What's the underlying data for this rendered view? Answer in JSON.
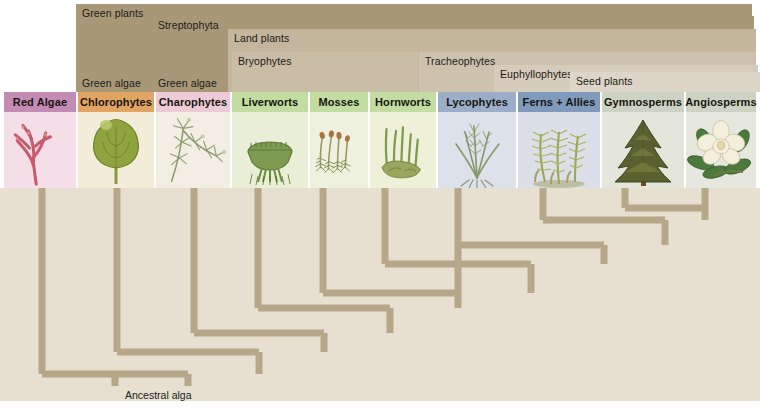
{
  "figure": {
    "type": "cladogram",
    "root_label": "Ancestral alga",
    "background_color": "#e7e0d0"
  },
  "clade_bands": [
    {
      "name": "green-plants",
      "label_top": "Green plants",
      "label_bottom": "Green algae",
      "color": "#a89878",
      "x": 76,
      "y": 4,
      "w": 676,
      "h": 88
    },
    {
      "name": "streptophyta",
      "label_top": "Streptophyta",
      "label_bottom": "Green algae",
      "color": "#a89878",
      "x": 152,
      "y": 16,
      "w": 602,
      "h": 76
    },
    {
      "name": "land-plants",
      "label_top": "Land plants",
      "label_bottom": "",
      "color": "#c4b69c",
      "x": 228,
      "y": 29,
      "w": 528,
      "h": 63
    },
    {
      "name": "bryophytes",
      "label_top": "Bryophytes",
      "label_bottom": "",
      "color": "#c9bda6",
      "x": 232,
      "y": 52,
      "w": 186,
      "h": 40
    },
    {
      "name": "tracheophytes",
      "label_top": "Tracheophytes",
      "label_bottom": "",
      "color": "#cdc2ae",
      "x": 419,
      "y": 52,
      "w": 337,
      "h": 40
    },
    {
      "name": "euphyllophytes",
      "label_top": "Euphyllophytes",
      "label_bottom": "",
      "color": "#d5ccbb",
      "x": 494,
      "y": 65,
      "w": 264,
      "h": 27
    },
    {
      "name": "seed-plants",
      "label_top": "Seed plants",
      "label_bottom": "",
      "color": "#ddd6c8",
      "x": 570,
      "y": 72,
      "w": 190,
      "h": 20
    }
  ],
  "taxa": [
    {
      "name": "red-algae",
      "label": "Red Algae",
      "tag_color": "#c48bb4",
      "panel_color": "#f4dfe9",
      "x": 4,
      "w": 72,
      "icon": "red-algae-icon"
    },
    {
      "name": "chlorophytes",
      "label": "Chlorophytes",
      "tag_color": "#e2a463",
      "panel_color": "#f2ecd9",
      "x": 78,
      "w": 76,
      "icon": "sea-lettuce-icon"
    },
    {
      "name": "charophytes",
      "label": "Charophytes",
      "tag_color": "#eec9d6",
      "panel_color": "#f2eee4",
      "x": 156,
      "w": 74,
      "icon": "chara-icon"
    },
    {
      "name": "liverworts",
      "label": "Liverworts",
      "tag_color": "#c3dca2",
      "panel_color": "#e9efd6",
      "x": 232,
      "w": 76,
      "icon": "liverwort-icon"
    },
    {
      "name": "mosses",
      "label": "Mosses",
      "tag_color": "#c3dca2",
      "panel_color": "#eef1de",
      "x": 310,
      "w": 58,
      "icon": "moss-icon"
    },
    {
      "name": "hornworts",
      "label": "Hornworts",
      "tag_color": "#c3dca2",
      "panel_color": "#eef0d8",
      "x": 370,
      "w": 66,
      "icon": "hornwort-icon"
    },
    {
      "name": "lycophytes",
      "label": "Lycophytes",
      "tag_color": "#9badc8",
      "panel_color": "#dde1ea",
      "x": 438,
      "w": 78,
      "icon": "lycophyte-icon"
    },
    {
      "name": "ferns-allies",
      "label": "Ferns + Allies",
      "tag_color": "#7f9abb",
      "panel_color": "#dbe0e8",
      "x": 518,
      "w": 82,
      "icon": "fern-icon"
    },
    {
      "name": "gymnosperms",
      "label": "Gymnosperms",
      "tag_color": "#cdd3c2",
      "panel_color": "#e4e6dc",
      "x": 602,
      "w": 82,
      "icon": "conifer-icon"
    },
    {
      "name": "angiosperms",
      "label": "Angiosperms",
      "tag_color": "#cdd3c2",
      "panel_color": "#e6e7de",
      "x": 686,
      "w": 70,
      "icon": "magnolia-icon"
    }
  ],
  "tree_geometry": {
    "branch_color": "#b6a789",
    "stroke_width": 7,
    "top_y": 0,
    "tips_x": [
      42,
      117,
      194,
      258,
      323,
      385,
      458,
      543,
      625,
      705
    ],
    "nodes": [
      {
        "name": "angiosperm-gymnosperm-node",
        "y": 20,
        "left": 625,
        "right": 705,
        "stem_to": 32
      },
      {
        "name": "seed-plants-node",
        "y": 32,
        "left": 543,
        "right": 665,
        "stem_to": 57
      },
      {
        "name": "euphyllophytes-node",
        "y": 57,
        "left": 458,
        "right": 604,
        "stem_to": 76
      },
      {
        "name": "tracheophytes-node",
        "y": 76,
        "left": 385,
        "right": 531,
        "stem_to": 105
      },
      {
        "name": "hornwort-node",
        "y": 105,
        "left": 323,
        "right": 458,
        "stem_to": 120
      },
      {
        "name": "moss-node",
        "y": 120,
        "left": 258,
        "right": 390,
        "stem_to": 145
      },
      {
        "name": "liverwort-node",
        "y": 145,
        "left": 194,
        "right": 324,
        "stem_to": 164
      },
      {
        "name": "charophyte-node",
        "y": 164,
        "left": 117,
        "right": 259,
        "stem_to": 186
      },
      {
        "name": "chlorophyte-node",
        "y": 186,
        "left": 42,
        "right": 188,
        "stem_to": 198
      }
    ],
    "root_x": 115,
    "root_bottom_y": 198
  }
}
